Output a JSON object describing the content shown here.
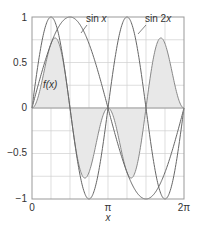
{
  "chart_data": {
    "type": "line",
    "title": "",
    "xlabel": "x",
    "ylabel": "",
    "xlim": [
      0,
      6.2832
    ],
    "ylim": [
      -1,
      1
    ],
    "grid": true,
    "x_ticks": [
      "0",
      "π",
      "2π"
    ],
    "y_ticks": [
      "1",
      "0.5",
      "0",
      "−0.5",
      "−1"
    ],
    "series": [
      {
        "name": "sin x",
        "expr": "sin(x)",
        "shaded": false
      },
      {
        "name": "sin 2x",
        "expr": "sin(2x)",
        "shaded": false
      },
      {
        "name": "f(x)",
        "expr": "sin(x)*sin(2x)",
        "shaded": true,
        "peak": 0.77
      }
    ],
    "annotations": [
      {
        "text": "sin x",
        "near": "x≈1.9, y≈1"
      },
      {
        "text": "sin 2x",
        "near": "x≈4.3, y≈1"
      },
      {
        "text": "f(x)",
        "near": "x≈0.6, y≈0.3"
      }
    ],
    "colors": {
      "curve": "#777777",
      "fill": "#e8e8e8",
      "grid": "#d0d0d0",
      "axis": "#888888"
    }
  },
  "labels": {
    "xlabel": "x",
    "sinx_label": "sin",
    "sinx_var": "x",
    "sin2x_label": "sin 2",
    "sin2x_var": "x",
    "fx_label": "f(x)",
    "yt_1": "1",
    "yt_05": "0.5",
    "yt_0": "0",
    "yt_m05": "−0.5",
    "yt_m1": "−1",
    "xt_0": "0",
    "xt_pi": "π",
    "xt_2pi": "2π"
  }
}
